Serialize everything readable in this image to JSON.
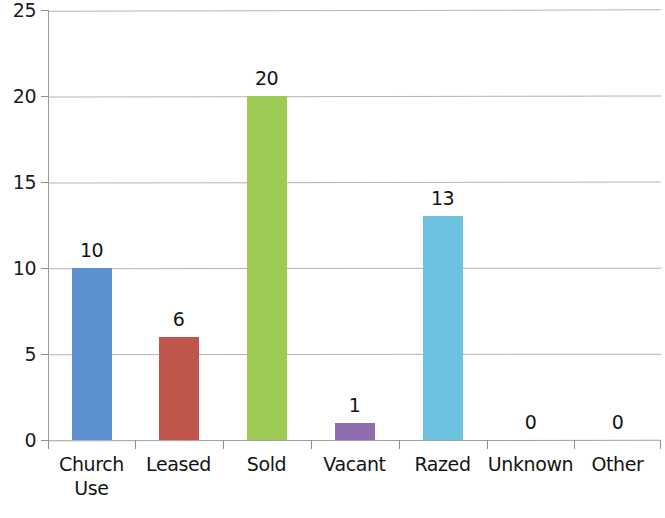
{
  "chart_data": {
    "type": "bar",
    "title": "",
    "subtitle": "",
    "xlabel": "",
    "ylabel": "",
    "categories": [
      "Church Use",
      "Leased",
      "Sold",
      "Vacant",
      "Razed",
      "Unknown",
      "Other"
    ],
    "category_lines": [
      [
        "Church",
        "Use"
      ],
      [
        "Leased"
      ],
      [
        "Sold"
      ],
      [
        "Vacant"
      ],
      [
        "Razed"
      ],
      [
        "Unknown"
      ],
      [
        "Other"
      ]
    ],
    "values": [
      10,
      6,
      20,
      1,
      13,
      0,
      0
    ],
    "value_labels": [
      "10",
      "6",
      "20",
      "1",
      "13",
      "0",
      "0"
    ],
    "bar_colors": [
      "#5B8FD0",
      "#C0564B",
      "#9DCA52",
      "#8E6CB0",
      "#6CC2DE",
      "#5B8FD0",
      "#C0564B"
    ],
    "ylim": [
      0,
      25
    ],
    "ytick_values": [
      0,
      5,
      10,
      15,
      20,
      25
    ],
    "ytick_labels": [
      "0",
      "5",
      "10",
      "15",
      "20",
      "25"
    ],
    "grid": "horizontal",
    "legend": "none",
    "legend_position": "none",
    "data_labels_shown": true,
    "background_color": "#FFFFFF",
    "gridline_color": "#A6A6A6",
    "axis_color": "#8F8F8F",
    "text_color": "#141414"
  }
}
